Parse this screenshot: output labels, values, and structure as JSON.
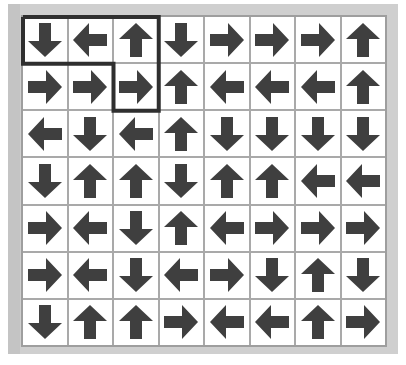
{
  "puzzle": {
    "rows": 7,
    "cols": 8,
    "grid": [
      [
        "down",
        "left",
        "up",
        "down",
        "right",
        "right",
        "right",
        "up"
      ],
      [
        "right",
        "right",
        "right",
        "up",
        "left",
        "left",
        "left",
        "up"
      ],
      [
        "left",
        "down",
        "left",
        "up",
        "down",
        "down",
        "down",
        "down"
      ],
      [
        "down",
        "up",
        "up",
        "down",
        "up",
        "up",
        "left",
        "left"
      ],
      [
        "right",
        "left",
        "down",
        "up",
        "left",
        "right",
        "right",
        "right"
      ],
      [
        "right",
        "left",
        "down",
        "left",
        "right",
        "down",
        "up",
        "down"
      ],
      [
        "down",
        "up",
        "up",
        "right",
        "left",
        "left",
        "up",
        "right"
      ]
    ],
    "highlighted_region": [
      [
        0,
        0
      ],
      [
        0,
        1
      ],
      [
        0,
        2
      ],
      [
        1,
        2
      ]
    ],
    "colors": {
      "arrow": "#3f3f3f",
      "cell_bg": "#ffffff",
      "grid_line": "#a9a9a9",
      "frame": "#cfcfcf",
      "highlight_border": "#2f2f2f"
    }
  }
}
